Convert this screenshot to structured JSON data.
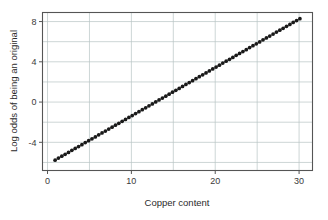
{
  "figure": {
    "background_color": "#ffffff",
    "plot_background_color": "#ffffff",
    "frame_color": "#555555",
    "gridline_color": "#b8c4c4",
    "point_color": "#1a1a1a",
    "fit_line_color": "#8c8c8c"
  },
  "chart_data": {
    "type": "scatter",
    "title": "",
    "subtitle": "",
    "xlabel": "Copper content",
    "ylabel": "Log odds of being an original",
    "xlim": [
      -0.6,
      31.6
    ],
    "ylim": [
      -6.8,
      8.9
    ],
    "xticks": [
      0,
      10,
      20,
      30
    ],
    "xtick_labels": [
      "0",
      "10",
      "20",
      "30"
    ],
    "yticks": [
      -4,
      0,
      4,
      8
    ],
    "ytick_labels": [
      "-4",
      "0",
      "4",
      "8"
    ],
    "x_minor_gridlines": [
      5,
      15,
      25
    ],
    "y_minor_gridlines": [
      -6,
      -2,
      2,
      6
    ],
    "grid": true,
    "grid_axis": "both",
    "legend": false,
    "legend_position": "none",
    "annotations": [],
    "fit_line": {
      "type": "linear",
      "slope": 0.4815,
      "intercept": -6.2,
      "x_start": 0.9,
      "x_end": 30.1,
      "y_start": -5.77,
      "y_end": 8.29
    },
    "series": [
      {
        "name": "Fitted log odds",
        "marker": "filled-circle",
        "x": [
          0.9,
          1.3,
          1.7,
          2.1,
          2.5,
          2.9,
          3.3,
          3.7,
          4.1,
          4.5,
          4.9,
          5.3,
          5.7,
          6.1,
          6.5,
          6.9,
          7.3,
          7.7,
          8.1,
          8.5,
          8.9,
          9.3,
          9.7,
          10.1,
          10.5,
          10.9,
          11.3,
          11.7,
          12.1,
          12.5,
          12.9,
          13.3,
          13.7,
          14.1,
          14.5,
          14.9,
          15.3,
          15.7,
          16.1,
          16.5,
          16.9,
          17.3,
          17.7,
          18.1,
          18.5,
          18.9,
          19.3,
          19.7,
          20.1,
          20.5,
          20.9,
          21.3,
          21.7,
          22.1,
          22.5,
          22.9,
          23.3,
          23.7,
          24.1,
          24.5,
          24.9,
          25.3,
          25.7,
          26.1,
          26.5,
          26.9,
          27.3,
          27.7,
          28.1,
          28.5,
          28.9,
          29.3,
          29.7,
          30.1
        ],
        "y": [
          -5.77,
          -5.57,
          -5.38,
          -5.19,
          -5.0,
          -4.8,
          -4.61,
          -4.42,
          -4.23,
          -4.03,
          -3.84,
          -3.65,
          -3.46,
          -3.26,
          -3.07,
          -2.88,
          -2.68,
          -2.49,
          -2.3,
          -2.11,
          -1.91,
          -1.72,
          -1.53,
          -1.34,
          -1.14,
          -0.95,
          -0.76,
          -0.57,
          -0.37,
          -0.18,
          0.01,
          0.21,
          0.4,
          0.59,
          0.78,
          0.98,
          1.17,
          1.36,
          1.55,
          1.75,
          1.94,
          2.13,
          2.32,
          2.52,
          2.71,
          2.9,
          3.09,
          3.29,
          3.48,
          3.67,
          3.87,
          4.06,
          4.25,
          4.44,
          4.64,
          4.83,
          5.02,
          5.21,
          5.41,
          5.6,
          5.79,
          5.98,
          6.18,
          6.37,
          6.56,
          6.76,
          6.95,
          7.14,
          7.33,
          7.53,
          7.72,
          7.91,
          8.1,
          8.29
        ]
      }
    ]
  }
}
